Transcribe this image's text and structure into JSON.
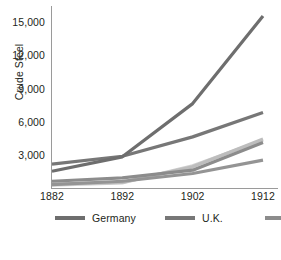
{
  "chart_data": {
    "type": "line",
    "title": "",
    "xlabel": "",
    "ylabel": "Crude Steel",
    "x": [
      1882,
      1892,
      1902,
      1912
    ],
    "xticklabels": [
      "1882",
      "1892",
      "1902",
      "1912"
    ],
    "yticklabels": [
      "3,000",
      "6,000",
      "9,000",
      "12,000",
      "15,000"
    ],
    "yticks": [
      3000,
      6000,
      9000,
      12000,
      15000
    ],
    "ylim": [
      0,
      16500
    ],
    "xlim": [
      1882,
      1912
    ],
    "grid": false,
    "legend_position": "below-axes",
    "series": [
      {
        "name": "Germany",
        "values": [
          1600,
          2900,
          7700,
          15600
        ],
        "color": "#6e6e6e"
      },
      {
        "name": "U.K.",
        "values": [
          2250,
          2950,
          4700,
          6900
        ],
        "color": "#777777"
      },
      {
        "name": "France",
        "values": [
          700,
          1000,
          1700,
          4200
        ],
        "color": "#8c8c8c"
      },
      {
        "name": "Austria",
        "values": [
          450,
          600,
          2000,
          4500
        ],
        "color": "#bdbdbd"
      },
      {
        "name": "Russia",
        "values": [
          350,
          550,
          2100,
          4400
        ],
        "color": "#d0d0d0"
      },
      {
        "name": "Belgium",
        "values": [
          400,
          700,
          1400,
          2600
        ],
        "color": "#949494"
      }
    ],
    "legend_entries": [
      {
        "label": "Germany",
        "color": "#6e6e6e"
      },
      {
        "label": "U.K.",
        "color": "#777777"
      },
      {
        "label": "France",
        "color": "#8c8c8c"
      },
      {
        "label": "Austria",
        "color": "#bdbdbd"
      },
      {
        "label": "Russia",
        "color": "#d0d0d0"
      },
      {
        "label": "Belgium",
        "color": "#949494"
      }
    ],
    "axis_color": "#9a9a9a",
    "text_color": "#231f20"
  },
  "caption": ""
}
